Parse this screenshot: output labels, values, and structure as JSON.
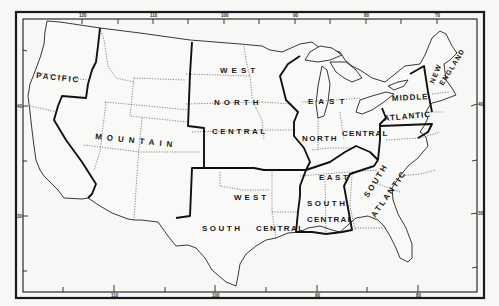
{
  "map": {
    "title": "United States Census Divisions",
    "colors": {
      "background": "#f7f7f5",
      "ink": "#1a1a1a",
      "state_border": "#555555"
    },
    "regions": [
      {
        "id": "pacific",
        "lines": [
          "PACIFIC"
        ]
      },
      {
        "id": "mountain",
        "lines": [
          "MOUNTAIN"
        ]
      },
      {
        "id": "west-north-central",
        "lines": [
          "WEST",
          "NORTH",
          "CENTRAL"
        ]
      },
      {
        "id": "west-south-central",
        "lines": [
          "WEST",
          "SOUTH",
          "CENTRAL"
        ]
      },
      {
        "id": "east-north-central",
        "lines": [
          "EAST",
          "NORTH",
          "CENTRAL"
        ]
      },
      {
        "id": "east-south-central",
        "lines": [
          "EAST",
          "SOUTH",
          "CENTRAL"
        ]
      },
      {
        "id": "south-atlantic",
        "lines": [
          "SOUTH",
          "ATLANTIC"
        ]
      },
      {
        "id": "middle-atlantic",
        "lines": [
          "MIDDLE",
          "ATLANTIC"
        ]
      },
      {
        "id": "new-england",
        "lines": [
          "NEW",
          "ENGLAND"
        ]
      }
    ],
    "longitude_ticks_top": [
      "120",
      "110",
      "100",
      "90",
      "80",
      "70"
    ],
    "longitude_ticks_bottom": [
      "110",
      "100",
      "90",
      "80"
    ],
    "latitude_ticks_left": [
      "40",
      "30"
    ],
    "latitude_ticks_right": [
      "40",
      "30"
    ]
  }
}
